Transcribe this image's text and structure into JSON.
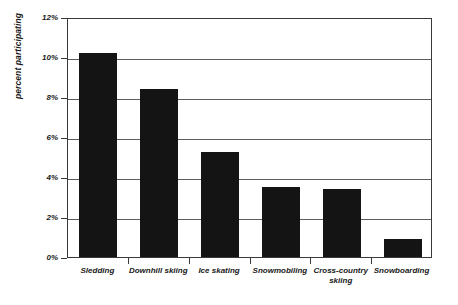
{
  "chart_data": {
    "type": "bar",
    "title": "",
    "subtitle": "",
    "xlabel": "",
    "ylabel": "percent participating",
    "ylim": [
      0,
      12
    ],
    "ytick_labels": [
      "0%",
      "2%",
      "4%",
      "6%",
      "8%",
      "10%",
      "12%"
    ],
    "ytick_values": [
      0,
      2,
      4,
      6,
      8,
      10,
      12
    ],
    "grid": true,
    "legend": "none",
    "bar_color": "#141414",
    "axis_color": "#3a3a3a",
    "gridline_color": "#5c5c5c",
    "categories": [
      "Sledding",
      "Downhill skiing",
      "Ice skating",
      "Snowmobiling",
      "Cross-country skiing",
      "Snowboarding"
    ],
    "values": [
      10.2,
      8.4,
      5.25,
      3.5,
      3.4,
      0.9
    ],
    "unit": "%"
  }
}
